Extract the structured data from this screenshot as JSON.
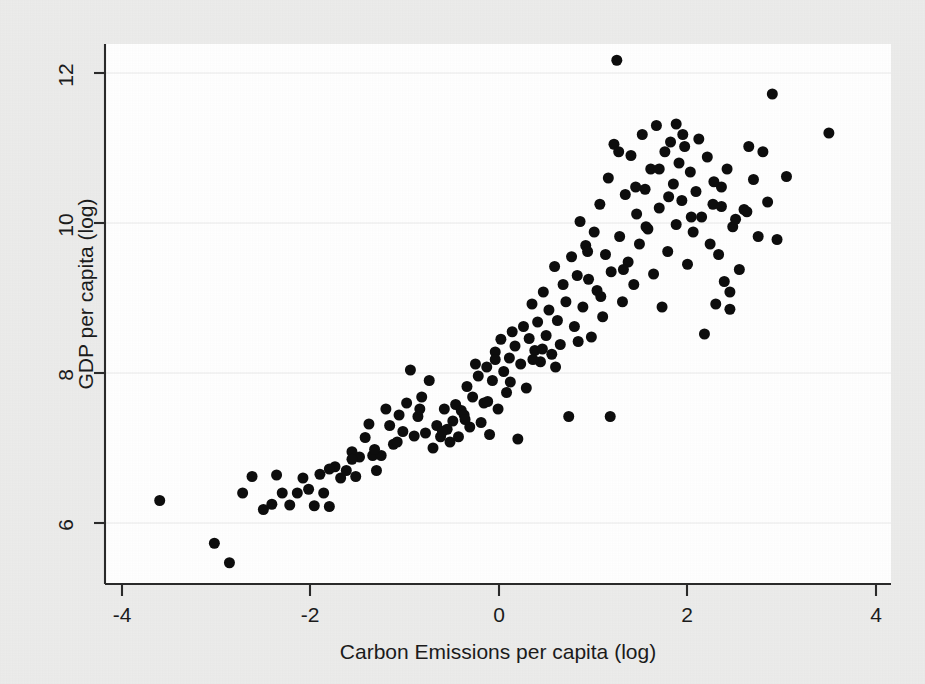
{
  "figure": {
    "background_color": "#ececeb",
    "plot_background_color": "#ffffff",
    "axis_color": "#2a2a2a",
    "gridline_color": "#efefef",
    "marker_color": "#0d0d0d"
  },
  "chart_data": {
    "type": "scatter",
    "title": "",
    "subtitle": "",
    "xlabel": "Carbon Emissions per capita (log)",
    "ylabel": "GDP per capita (log)",
    "xlim": [
      -4.2,
      4.2
    ],
    "ylim": [
      5.2,
      12.45
    ],
    "xticks": [
      -4,
      -2,
      0,
      2,
      4
    ],
    "xtick_labels": [
      "-4",
      "-2",
      "0",
      "2",
      "4"
    ],
    "yticks": [
      6,
      8,
      10,
      12
    ],
    "ytick_labels": [
      "6",
      "8",
      "10",
      "12"
    ],
    "grid": true,
    "grid_axis": "y",
    "legend": null,
    "legend_position": "none",
    "marker": "filled-circle",
    "marker_size": 11,
    "n_points": 188,
    "annotations": [],
    "x": [
      -3.6,
      -3.02,
      -2.86,
      -2.72,
      -2.62,
      -2.5,
      -2.41,
      -2.36,
      -2.3,
      -2.22,
      -2.14,
      -2.08,
      -2.02,
      -1.96,
      -1.9,
      -1.86,
      -1.8,
      -1.74,
      -1.68,
      -1.62,
      -1.56,
      -1.52,
      -1.48,
      -1.42,
      -1.38,
      -1.34,
      -1.3,
      -1.25,
      -1.2,
      -1.16,
      -1.12,
      -1.06,
      -1.02,
      -0.98,
      -0.94,
      -0.9,
      -0.86,
      -0.82,
      -0.78,
      -0.74,
      -0.7,
      -0.66,
      -0.62,
      -0.58,
      -0.55,
      -0.52,
      -0.49,
      -0.46,
      -0.43,
      -0.4,
      -0.37,
      -0.34,
      -0.31,
      -0.28,
      -0.25,
      -0.22,
      -0.19,
      -0.16,
      -0.13,
      -0.1,
      -0.07,
      -0.04,
      -0.01,
      0.02,
      0.05,
      0.08,
      0.11,
      0.14,
      0.17,
      0.2,
      0.23,
      0.26,
      0.29,
      0.32,
      0.35,
      0.38,
      0.41,
      0.44,
      0.47,
      0.5,
      0.53,
      0.56,
      0.59,
      0.62,
      0.65,
      0.68,
      0.71,
      0.74,
      0.77,
      0.8,
      0.83,
      0.86,
      0.89,
      0.92,
      0.95,
      0.98,
      1.01,
      1.04,
      1.07,
      1.1,
      1.13,
      1.16,
      1.19,
      1.22,
      1.25,
      1.28,
      1.31,
      1.34,
      1.37,
      1.4,
      1.43,
      1.46,
      1.49,
      1.52,
      1.55,
      1.58,
      1.61,
      1.64,
      1.67,
      1.7,
      1.73,
      1.76,
      1.79,
      1.82,
      1.85,
      1.88,
      1.91,
      1.94,
      1.97,
      2.0,
      2.03,
      2.06,
      2.09,
      2.12,
      2.15,
      2.18,
      2.21,
      2.24,
      2.27,
      2.3,
      2.33,
      2.36,
      2.39,
      2.42,
      2.45,
      2.48,
      2.51,
      2.55,
      2.6,
      2.65,
      2.7,
      2.75,
      2.8,
      2.85,
      2.9,
      2.95,
      3.05,
      3.5,
      1.18,
      1.95,
      0.6,
      0.84,
      1.08,
      1.32,
      1.56,
      1.8,
      2.04,
      2.28,
      0.36,
      0.12,
      -0.12,
      -0.36,
      -0.6,
      -0.84,
      -1.08,
      -1.32,
      -1.56,
      -1.8,
      1.45,
      1.7,
      2.36,
      2.63,
      1.27,
      0.94,
      0.46,
      -0.04,
      1.88,
      2.45
    ],
    "y": [
      6.3,
      5.73,
      5.47,
      6.4,
      6.62,
      6.18,
      6.25,
      6.64,
      6.4,
      6.24,
      6.4,
      6.6,
      6.45,
      6.23,
      6.65,
      6.4,
      6.22,
      6.75,
      6.6,
      6.7,
      6.95,
      6.62,
      6.88,
      7.14,
      7.32,
      6.9,
      6.7,
      6.9,
      7.52,
      7.3,
      7.05,
      7.44,
      7.22,
      7.6,
      8.04,
      7.16,
      7.42,
      7.68,
      7.2,
      7.9,
      7.0,
      7.3,
      7.15,
      7.52,
      7.25,
      7.08,
      7.36,
      7.58,
      7.15,
      7.5,
      7.44,
      7.82,
      7.28,
      7.68,
      8.12,
      7.96,
      7.34,
      7.6,
      8.08,
      7.18,
      7.9,
      8.28,
      7.52,
      8.45,
      8.02,
      7.74,
      8.2,
      8.55,
      8.36,
      7.12,
      8.12,
      8.62,
      7.8,
      8.46,
      8.92,
      8.3,
      8.68,
      8.15,
      9.08,
      8.5,
      8.84,
      8.25,
      9.42,
      8.7,
      8.38,
      9.18,
      8.95,
      7.42,
      9.55,
      8.62,
      9.3,
      10.02,
      8.88,
      9.7,
      9.25,
      8.48,
      9.88,
      9.1,
      10.25,
      8.75,
      9.58,
      10.6,
      9.35,
      11.05,
      12.17,
      9.82,
      8.95,
      10.38,
      9.48,
      10.9,
      9.18,
      10.12,
      9.72,
      11.18,
      10.45,
      9.92,
      10.72,
      9.32,
      11.3,
      10.2,
      8.88,
      10.95,
      9.62,
      11.08,
      10.52,
      9.98,
      10.8,
      10.3,
      11.02,
      9.45,
      10.68,
      9.88,
      10.42,
      11.12,
      10.08,
      8.52,
      10.88,
      9.72,
      10.25,
      8.92,
      9.58,
      10.48,
      9.22,
      10.72,
      8.85,
      9.95,
      10.05,
      9.38,
      10.18,
      11.02,
      10.58,
      9.82,
      10.95,
      10.28,
      11.72,
      9.78,
      10.62,
      11.2,
      7.42,
      11.18,
      8.08,
      8.42,
      9.02,
      9.38,
      9.95,
      10.35,
      10.08,
      10.55,
      8.18,
      7.88,
      7.62,
      7.38,
      7.22,
      7.52,
      7.08,
      6.98,
      6.85,
      6.72,
      10.48,
      10.72,
      10.22,
      10.15,
      10.95,
      9.62,
      8.32,
      8.18,
      11.32,
      9.08
    ]
  }
}
